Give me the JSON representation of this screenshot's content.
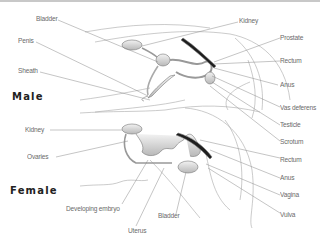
{
  "diagram": {
    "sections": {
      "male": "Male",
      "female": "Female"
    },
    "male_labels": {
      "bladder": "Bladder",
      "penis": "Penis",
      "sheath": "Sheath",
      "kidney": "Kidney",
      "prostate": "Prostate",
      "rectum": "Rectum",
      "anus": "Anus",
      "vas_deferens": "Vas deferens",
      "testicle": "Testicle",
      "scrotum": "Scrotum"
    },
    "female_labels": {
      "kidney": "Kidney",
      "ovaries": "Ovaries",
      "developing_embryo": "Developing embryo",
      "uterus": "Uterus",
      "bladder": "Bladder",
      "rectum": "Rectum",
      "anus": "Anus",
      "vagina": "Vagina",
      "vulva": "Vulva"
    },
    "colors": {
      "line": "#8a8a8a",
      "organ_fill": "#d9d9d9",
      "rectum_fill": "#1e1e1e",
      "text": "#6a6a6a"
    }
  }
}
